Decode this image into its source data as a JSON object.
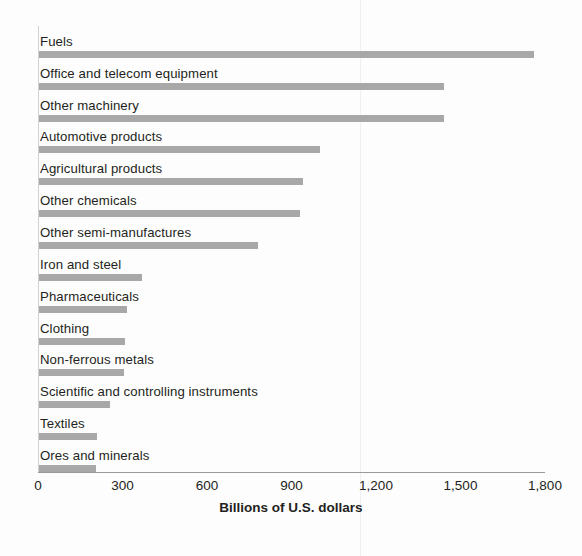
{
  "chart_data": {
    "type": "bar",
    "orientation": "horizontal",
    "title": "",
    "subtitle": "",
    "xlabel": "Billions of U.S. dollars",
    "ylabel": "",
    "xlim": [
      0,
      1800
    ],
    "xticks": [
      "0",
      "300",
      "600",
      "900",
      "1,200",
      "1,500",
      "1,800"
    ],
    "xtick_values": [
      0,
      300,
      600,
      900,
      1200,
      1500,
      1800
    ],
    "grid": false,
    "legend": "none",
    "label_position": "above-bar",
    "bar_color": "#a8a8a8",
    "axis_color": "#9a9a9a",
    "categories": [
      "Fuels",
      "Office and telecom equipment",
      "Other machinery",
      "Automotive products",
      "Agricultural products",
      "Other chemicals",
      "Other semi-manufactures",
      "Iron and steel",
      "Pharmaceuticals",
      "Clothing",
      "Non-ferrous metals",
      "Scientific and controlling instruments",
      "Textiles",
      "Ores and minerals"
    ],
    "values": [
      1760,
      1440,
      1440,
      1000,
      940,
      930,
      780,
      370,
      315,
      310,
      305,
      255,
      210,
      205
    ]
  }
}
